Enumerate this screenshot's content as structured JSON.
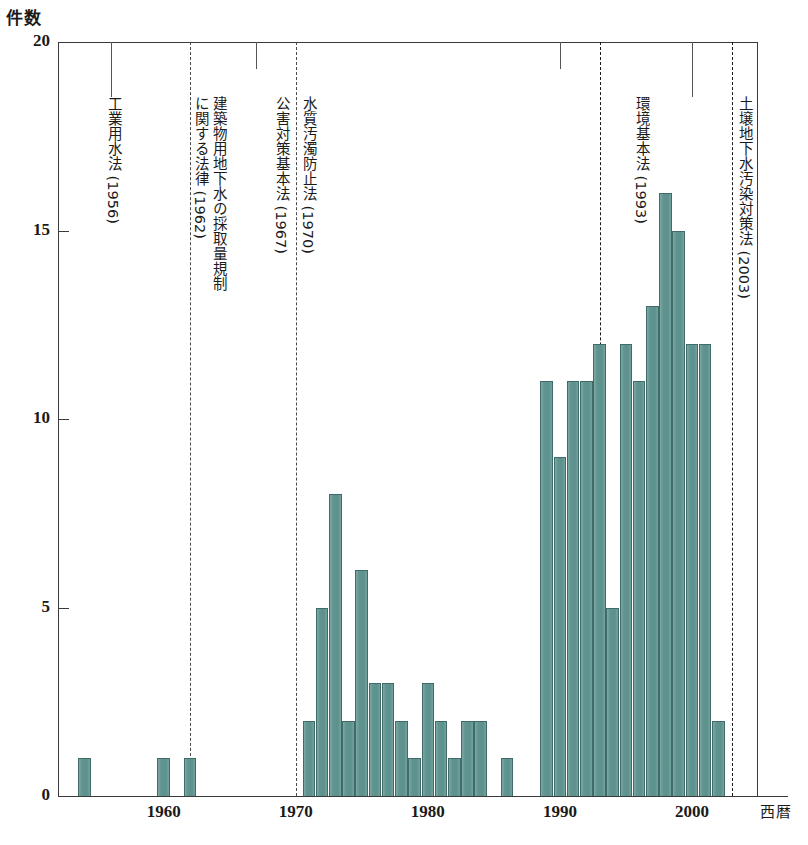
{
  "axes": {
    "y_title": "件数",
    "x_title": "西暦",
    "y_ticks": [
      "0",
      "5",
      "10",
      "15",
      "20"
    ],
    "x_ticks": [
      "1960",
      "1970",
      "1980",
      "1990",
      "2000"
    ]
  },
  "colors": {
    "bar_fill": "#5f9490",
    "bar_edge": "#3f6b68",
    "axis": "#3a3a3a",
    "event_line": "#4a4a4a",
    "background": "#ffffff"
  },
  "events": [
    {
      "name": "industrial-water-law",
      "year": 1956,
      "lines": [
        "工業用水法 (1956)"
      ],
      "has_line": false,
      "style": "plain"
    },
    {
      "name": "building-groundwater-extraction-law",
      "year": 1962,
      "lines": [
        "建築物用地下水の採取量規制",
        "に関する法律 (1962)"
      ],
      "has_line": true,
      "style": "plain"
    },
    {
      "name": "pollution-countermeasures-basic-law",
      "year": 1967,
      "lines": [
        "公害対策基本法 (1967)"
      ],
      "has_line": false,
      "style": "plain"
    },
    {
      "name": "water-pollution-control-law",
      "year": 1970,
      "lines": [
        "水質汚濁防止法 (1970)"
      ],
      "has_line": true,
      "style": "plain"
    },
    {
      "name": "basic-environment-law",
      "year": 1993,
      "lines": [
        "環境基本法 (1993)"
      ],
      "has_line": true,
      "style": "dark"
    },
    {
      "name": "soil-groundwater-contamination-law",
      "year": 2003,
      "lines": [
        "土壌地下水汚染対策法 (2003)"
      ],
      "has_line": true,
      "style": "dark"
    }
  ],
  "chart_data": {
    "type": "bar",
    "title": "",
    "xlabel": "西暦",
    "ylabel": "件数",
    "ylim": [
      0,
      20
    ],
    "xlim": [
      1952,
      2005
    ],
    "grid": false,
    "legend": "none",
    "categories": [
      1954,
      1960,
      1962,
      1971,
      1972,
      1973,
      1974,
      1975,
      1976,
      1977,
      1978,
      1979,
      1980,
      1981,
      1982,
      1983,
      1984,
      1986,
      1989,
      1990,
      1991,
      1992,
      1993,
      1994,
      1995,
      1996,
      1997,
      1998,
      1999,
      2000,
      2001,
      2002
    ],
    "values": [
      1,
      1,
      1,
      2,
      5,
      8,
      2,
      6,
      3,
      3,
      2,
      1,
      3,
      2,
      1,
      2,
      2,
      1,
      11,
      9,
      11,
      11,
      12,
      5,
      12,
      11,
      13,
      16,
      15,
      12,
      12,
      2
    ],
    "annotations": [
      "工業用水法 (1956)",
      "建築物用地下水の採取量規制に関する法律 (1962)",
      "公害対策基本法 (1967)",
      "水質汚濁防止法 (1970)",
      "環境基本法 (1993)",
      "土壌地下水汚染対策法 (2003)"
    ]
  }
}
